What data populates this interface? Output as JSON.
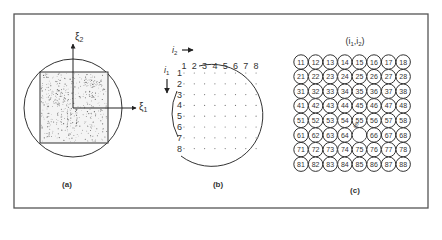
{
  "figure": {
    "panels": [
      {
        "id": "a",
        "caption": "(a)",
        "axis_x_label": "ξ",
        "axis_x_sub": "1",
        "axis_y_label": "ξ",
        "axis_y_sub": "2"
      },
      {
        "id": "b",
        "caption": "(b)",
        "col_axis_label": "i",
        "col_axis_sub": "2",
        "row_axis_label": "i",
        "row_axis_sub": "1",
        "col_labels": [
          "1",
          "2",
          "3",
          "4",
          "5",
          "6",
          "7",
          "8"
        ],
        "row_labels": [
          "1",
          "2",
          "3",
          "4",
          "5",
          "6",
          "7",
          "8"
        ]
      },
      {
        "id": "c",
        "caption": "(c)",
        "title": "(i",
        "title_sub1": "1",
        "title_mid": ",i",
        "title_sub2": "2",
        "title_end": ")",
        "cells": [
          [
            "11",
            "12",
            "13",
            "14",
            "15",
            "16",
            "17",
            "18"
          ],
          [
            "21",
            "22",
            "23",
            "24",
            "25",
            "26",
            "27",
            "28"
          ],
          [
            "31",
            "32",
            "33",
            "34",
            "35",
            "36",
            "37",
            "38"
          ],
          [
            "41",
            "42",
            "43",
            "44",
            "45",
            "46",
            "47",
            "48"
          ],
          [
            "51",
            "52",
            "53",
            "54",
            "55",
            "56",
            "57",
            "58"
          ],
          [
            "61",
            "62",
            "63",
            "64",
            "65",
            "66",
            "67",
            "68"
          ],
          [
            "71",
            "72",
            "73",
            "74",
            "75",
            "76",
            "77",
            "78"
          ],
          [
            "81",
            "82",
            "83",
            "84",
            "85",
            "86",
            "87",
            "88"
          ]
        ],
        "highlight_cell": "65",
        "highlight_label": "65"
      }
    ]
  }
}
